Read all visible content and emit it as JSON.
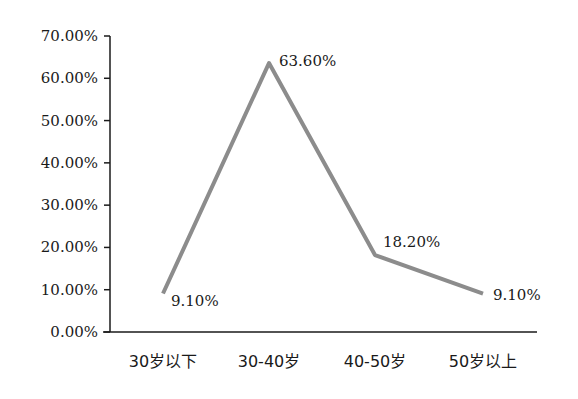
{
  "chart_data": {
    "type": "line",
    "title": "",
    "xlabel": "",
    "ylabel": "",
    "categories": [
      "30岁以下",
      "30-40岁",
      "40-50岁",
      "50岁以上"
    ],
    "series": [
      {
        "name": "",
        "values": [
          9.1,
          63.6,
          18.2,
          9.1
        ],
        "color": "#8c8c8c"
      }
    ],
    "data_labels": [
      "9.10%",
      "63.60%",
      "18.20%",
      "9.10%"
    ],
    "y_ticks": [
      "0.00%",
      "10.00%",
      "20.00%",
      "30.00%",
      "40.00%",
      "50.00%",
      "60.00%",
      "70.00%"
    ],
    "ylim": [
      0,
      70
    ],
    "grid": false,
    "legend": "none"
  }
}
